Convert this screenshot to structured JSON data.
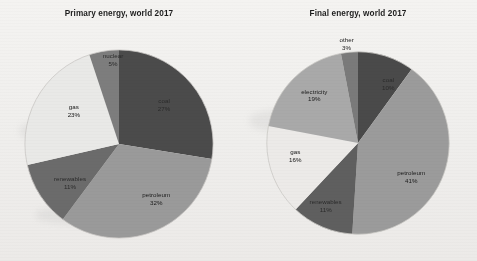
{
  "document": {
    "background_color": "#f2f1ef",
    "kind": "scanned-figure-two-pie-charts"
  },
  "charts": [
    {
      "id": "primary-energy",
      "title": "Primary energy, world 2017"
    },
    {
      "id": "final-energy",
      "title": "Final energy, world 2017"
    }
  ],
  "labels": {
    "primary": {
      "coal_name": "coal",
      "coal_pct": "27%",
      "petroleum_name": "petroleum",
      "petroleum_pct": "32%",
      "renewables_name": "renewables",
      "renewables_pct": "11%",
      "gas_name": "gas",
      "gas_pct": "23%",
      "nuclear_name": "nuclear",
      "nuclear_pct": "5%"
    },
    "final": {
      "coal_name": "coal",
      "coal_pct": "10%",
      "petroleum_name": "petroleum",
      "petroleum_pct": "41%",
      "renewables_name": "renewables",
      "renewables_pct": "11%",
      "gas_name": "gas",
      "gas_pct": "16%",
      "electricity_name": "electricity",
      "electricity_pct": "19%",
      "other_name": "other",
      "other_pct": "3%"
    }
  },
  "chart_data": [
    {
      "type": "pie",
      "title": "Primary energy, world 2017",
      "xlabel": "",
      "ylabel": "",
      "legend": "none",
      "labels_position": "inside-slices",
      "start_angle_deg": 0,
      "direction": "clockwise",
      "categories": [
        "coal",
        "petroleum",
        "renewables",
        "gas",
        "nuclear"
      ],
      "values": [
        27,
        32,
        11,
        23,
        5
      ],
      "value_unit": "percent",
      "colors": [
        "#4b4b4b",
        "#9a9a9a",
        "#6b6b6b",
        "#e9e9e7",
        "#7d7d7d"
      ],
      "slices": [
        {
          "label": "coal",
          "value": 27,
          "display": "27%",
          "color": "#4b4b4b"
        },
        {
          "label": "petroleum",
          "value": 32,
          "display": "32%",
          "color": "#9a9a9a"
        },
        {
          "label": "renewables",
          "value": 11,
          "display": "11%",
          "color": "#6b6b6b"
        },
        {
          "label": "gas",
          "value": 23,
          "display": "23%",
          "color": "#e9e9e7"
        },
        {
          "label": "nuclear",
          "value": 5,
          "display": "5%",
          "color": "#7d7d7d"
        }
      ]
    },
    {
      "type": "pie",
      "title": "Final energy, world 2017",
      "xlabel": "",
      "ylabel": "",
      "legend": "none",
      "labels_position": "inside-slices",
      "start_angle_deg": 0,
      "direction": "clockwise",
      "categories": [
        "coal",
        "petroleum",
        "renewables",
        "gas",
        "electricity",
        "other"
      ],
      "values": [
        10,
        41,
        11,
        16,
        19,
        3
      ],
      "value_unit": "percent",
      "colors": [
        "#4a4a4a",
        "#9b9b9b",
        "#5f5f5f",
        "#eceae8",
        "#a9a9a9",
        "#7a7a7a"
      ],
      "slices": [
        {
          "label": "coal",
          "value": 10,
          "display": "10%",
          "color": "#4a4a4a"
        },
        {
          "label": "petroleum",
          "value": 41,
          "display": "41%",
          "color": "#9b9b9b"
        },
        {
          "label": "renewables",
          "value": 11,
          "display": "11%",
          "color": "#5f5f5f"
        },
        {
          "label": "gas",
          "value": 16,
          "display": "16%",
          "color": "#eceae8"
        },
        {
          "label": "electricity",
          "value": 19,
          "display": "19%",
          "color": "#a9a9a9"
        },
        {
          "label": "other",
          "value": 3,
          "display": "3%",
          "color": "#7a7a7a"
        }
      ]
    }
  ]
}
